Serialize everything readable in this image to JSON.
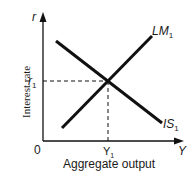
{
  "diagram": {
    "type": "IS-LM",
    "y_axis": {
      "symbol": "r",
      "label": "Interest rate"
    },
    "x_axis": {
      "symbol": "Y",
      "label": "Aggregate output"
    },
    "origin_label": "0",
    "curves": [
      {
        "name": "LM",
        "sub": "1",
        "slope": "upward"
      },
      {
        "name": "IS",
        "sub": "1",
        "slope": "downward"
      }
    ],
    "equilibrium": {
      "r_label": "r",
      "r_sub": "1",
      "y_label": "Y",
      "y_sub": "1"
    },
    "colors": {
      "line": "#111111",
      "text": "#1a1a1a"
    }
  }
}
